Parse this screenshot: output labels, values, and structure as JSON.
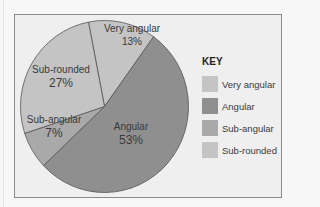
{
  "chart_data": {
    "type": "pie",
    "title": "",
    "categories": [
      "Very angular",
      "Angular",
      "Sub-angular",
      "Sub-rounded"
    ],
    "values": [
      13,
      53,
      7,
      27
    ],
    "unit": "%",
    "colors": [
      "#c4c4c4",
      "#8f8f8f",
      "#a9a9a9",
      "#c4c4c4"
    ],
    "slice_labels": [
      {
        "name": "Very angular",
        "pct": "13%"
      },
      {
        "name": "Angular",
        "pct": "53%"
      },
      {
        "name": "Sub-angular",
        "pct": "7%"
      },
      {
        "name": "Sub-rounded",
        "pct": "27%"
      }
    ],
    "legend": {
      "title": "KEY",
      "position": "right",
      "entries": [
        "Very angular",
        "Angular",
        "Sub-angular",
        "Sub-rounded"
      ]
    },
    "start_angle_deg": -11
  },
  "legend": {
    "title": "KEY",
    "items": [
      {
        "label": "Very angular",
        "color": "#c4c4c4"
      },
      {
        "label": "Angular",
        "color": "#8f8f8f"
      },
      {
        "label": "Sub-angular",
        "color": "#a9a9a9"
      },
      {
        "label": "Sub-rounded",
        "color": "#c4c4c4"
      }
    ]
  }
}
